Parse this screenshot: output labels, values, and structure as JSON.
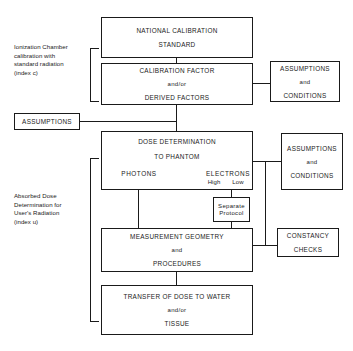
{
  "diagram": {
    "ink_color": "#1a1a1a",
    "background": "#ffffff"
  },
  "side_labels": [
    {
      "id": "ionization-chamber",
      "text": "Ionization Chamber\ncalibration with\nstandard radiation\n(index c)"
    },
    {
      "id": "absorbed-dose",
      "text": "Absorbed Dose\nDetermination for\nUser's Radiation\n(index u)"
    }
  ],
  "boxes": {
    "national_standard": {
      "lines": [
        "NATIONAL CALIBRATION",
        "STANDARD"
      ]
    },
    "calibration_factor": {
      "lines": [
        "CALIBRATION FACTOR",
        "and/or",
        "DERIVED FACTORS"
      ]
    },
    "assumptions_conditions_top": {
      "lines": [
        "ASSUMPTIONS",
        "and",
        "CONDITIONS"
      ]
    },
    "assumptions_left": {
      "lines": [
        "ASSUMPTIONS"
      ]
    },
    "dose_determination": {
      "lines": [
        "DOSE DETERMINATION",
        "TO PHANTOM"
      ],
      "photons": "PHOTONS",
      "electrons": "ELECTRONS",
      "electrons_sub_high": "High",
      "electrons_sub_low": "Low"
    },
    "assumptions_conditions_mid": {
      "lines": [
        "ASSUMPTIONS",
        "and",
        "CONDITIONS"
      ]
    },
    "separate_protocol": {
      "lines": [
        "Separate",
        "Protocol"
      ]
    },
    "measurement_geometry": {
      "lines": [
        "MEASUREMENT GEOMETRY",
        "and",
        "PROCEDURES"
      ]
    },
    "constancy_checks": {
      "lines": [
        "CONSTANCY",
        "CHECKS"
      ]
    },
    "transfer_dose": {
      "lines": [
        "TRANSFER OF DOSE TO WATER",
        "and/or",
        "TISSUE"
      ]
    }
  }
}
